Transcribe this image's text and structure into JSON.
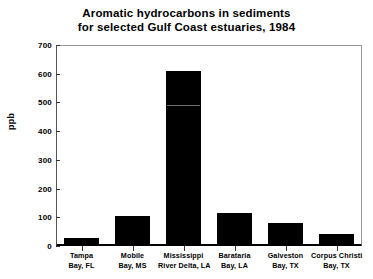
{
  "chart_data": {
    "type": "bar",
    "title": "Aromatic hydrocarbons in sediments for selected Gulf Coast estuaries, 1984",
    "title_lines": [
      "Aromatic hydrocarbons in sediments",
      "for selected Gulf Coast estuaries, 1984"
    ],
    "xlabel": "",
    "ylabel": "ppb",
    "ylim": [
      0,
      700
    ],
    "ytick_values": [
      0,
      100,
      200,
      300,
      400,
      500,
      600,
      700
    ],
    "ytick_labels": [
      "0",
      "100",
      "200",
      "300",
      "400",
      "500",
      "600",
      "700"
    ],
    "grid": false,
    "legend": null,
    "bar_color": "#000000",
    "categories": [
      "Tampa Bay, FL",
      "Mobile Bay, MS",
      "Mississippi River Delta, LA",
      "Barataria Bay, LA",
      "Galveston Bay, TX",
      "Corpus Christi Bay, TX"
    ],
    "category_label_lines": [
      [
        "Tampa",
        "Bay, FL"
      ],
      [
        "Mobile",
        "Bay, MS"
      ],
      [
        "Mississippi",
        "River Delta, LA"
      ],
      [
        "Barataria",
        "Bay, LA"
      ],
      [
        "Galveston",
        "Bay, TX"
      ],
      [
        "Corpus Christi",
        "Bay, TX"
      ]
    ],
    "values": [
      28,
      104,
      610,
      115,
      80,
      42
    ],
    "units": "ppb"
  }
}
